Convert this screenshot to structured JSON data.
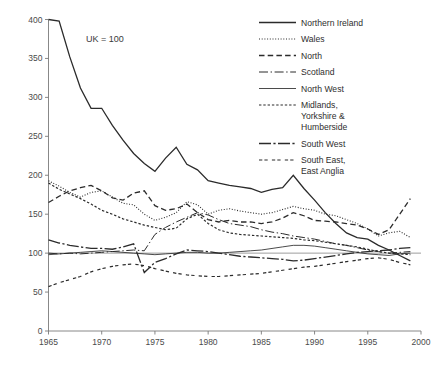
{
  "chart_data": {
    "type": "line",
    "title": "",
    "subtitle": "",
    "annotation": "UK = 100",
    "xlabel": "",
    "ylabel": "",
    "xlim": [
      1965,
      2000
    ],
    "ylim": [
      0,
      400
    ],
    "xticks": [
      1965,
      1970,
      1975,
      1980,
      1985,
      1990,
      1995,
      2000
    ],
    "yticks": [
      0,
      50,
      100,
      150,
      200,
      250,
      300,
      350,
      400
    ],
    "grid": false,
    "legend_position": "top-right",
    "reference_line": 100,
    "x": [
      1965,
      1966,
      1967,
      1968,
      1969,
      1970,
      1971,
      1972,
      1973,
      1974,
      1975,
      1976,
      1977,
      1978,
      1979,
      1980,
      1981,
      1982,
      1983,
      1984,
      1985,
      1986,
      1987,
      1988,
      1989,
      1990,
      1991,
      1992,
      1993,
      1994,
      1995,
      1996,
      1997,
      1998,
      1999
    ],
    "series": [
      {
        "name": "Northern Ireland",
        "dash": "none",
        "width": 1.3,
        "values": [
          400,
          398,
          352,
          312,
          286,
          286,
          264,
          245,
          228,
          215,
          205,
          222,
          236,
          214,
          207,
          193,
          190,
          187,
          185,
          183,
          178,
          182,
          184,
          200,
          183,
          168,
          152,
          138,
          126,
          120,
          118,
          110,
          104,
          97,
          90
        ]
      },
      {
        "name": "Wales",
        "dash": "dotted",
        "width": 1.1,
        "values": [
          193,
          186,
          178,
          172,
          178,
          180,
          172,
          164,
          162,
          150,
          142,
          146,
          152,
          166,
          162,
          150,
          155,
          157,
          154,
          152,
          150,
          152,
          156,
          160,
          157,
          155,
          150,
          148,
          143,
          138,
          131,
          122,
          126,
          128,
          120
        ]
      },
      {
        "name": "North",
        "dash": "dashed",
        "width": 1.3,
        "values": [
          165,
          173,
          180,
          184,
          187,
          180,
          171,
          168,
          177,
          180,
          161,
          155,
          157,
          163,
          152,
          143,
          140,
          142,
          140,
          140,
          138,
          140,
          145,
          152,
          148,
          142,
          141,
          140,
          138,
          136,
          131,
          124,
          130,
          150,
          170
        ]
      },
      {
        "name": "Scotland",
        "dash": "dashdot",
        "width": 1.0,
        "values": [
          100,
          99,
          100,
          99,
          100,
          101,
          102,
          103,
          104,
          103,
          124,
          133,
          140,
          146,
          152,
          149,
          143,
          138,
          136,
          134,
          130,
          127,
          125,
          122,
          120,
          118,
          115,
          112,
          110,
          107,
          104,
          102,
          100,
          101,
          102
        ]
      },
      {
        "name": "North West",
        "dash": "none",
        "width": 0.85,
        "values": [
          98,
          99,
          100,
          101,
          102,
          103,
          102,
          101,
          100,
          99,
          98,
          99,
          100,
          101,
          101,
          100,
          100,
          101,
          102,
          103,
          104,
          106,
          108,
          110,
          110,
          109,
          107,
          105,
          103,
          101,
          99,
          98,
          97,
          99,
          100
        ]
      },
      {
        "name": "Midlands, Yorkshire & Humberside",
        "dash": "dotted-coarse",
        "width": 1.2,
        "values": [
          190,
          182,
          176,
          170,
          163,
          155,
          150,
          144,
          140,
          136,
          133,
          130,
          132,
          144,
          150,
          138,
          130,
          126,
          124,
          123,
          122,
          121,
          120,
          119,
          117,
          116,
          114,
          112,
          110,
          108,
          105,
          102,
          100,
          99,
          98
        ]
      },
      {
        "name": "South West",
        "dash": "longdash-dot",
        "width": 1.3,
        "values": [
          117,
          113,
          110,
          108,
          106,
          106,
          105,
          108,
          112,
          75,
          88,
          93,
          99,
          104,
          103,
          102,
          100,
          98,
          96,
          95,
          94,
          93,
          92,
          90,
          91,
          93,
          95,
          97,
          99,
          101,
          102,
          103,
          104,
          106,
          107
        ]
      },
      {
        "name": "South East, East Anglia",
        "dash": "short-double",
        "width": 1.2,
        "values": [
          57,
          62,
          66,
          70,
          76,
          80,
          83,
          85,
          86,
          84,
          80,
          77,
          74,
          72,
          71,
          70,
          70,
          71,
          72,
          73,
          74,
          76,
          78,
          80,
          82,
          83,
          85,
          87,
          89,
          91,
          93,
          94,
          92,
          88,
          85
        ]
      }
    ]
  },
  "legend": {
    "items": [
      {
        "label": "Northern Ireland"
      },
      {
        "label": "Wales"
      },
      {
        "label": "North"
      },
      {
        "label": "Scotland"
      },
      {
        "label": "North West"
      },
      {
        "label": "Midlands,"
      },
      {
        "label": "Yorkshire &"
      },
      {
        "label": "Humberside"
      },
      {
        "label": "South West"
      },
      {
        "label": "South East,"
      },
      {
        "label": "East Anglia"
      }
    ]
  },
  "axis": {
    "x_tick_labels": [
      "1965",
      "1970",
      "1975",
      "1980",
      "1985",
      "1990",
      "1995",
      "2000"
    ],
    "y_tick_labels": [
      "0",
      "50",
      "100",
      "150",
      "200",
      "250",
      "300",
      "350",
      "400"
    ]
  },
  "colors": {
    "line": "#2b2b2b",
    "axis": "#7a7a7a",
    "text": "#3a3a3a",
    "background": "#ffffff"
  }
}
